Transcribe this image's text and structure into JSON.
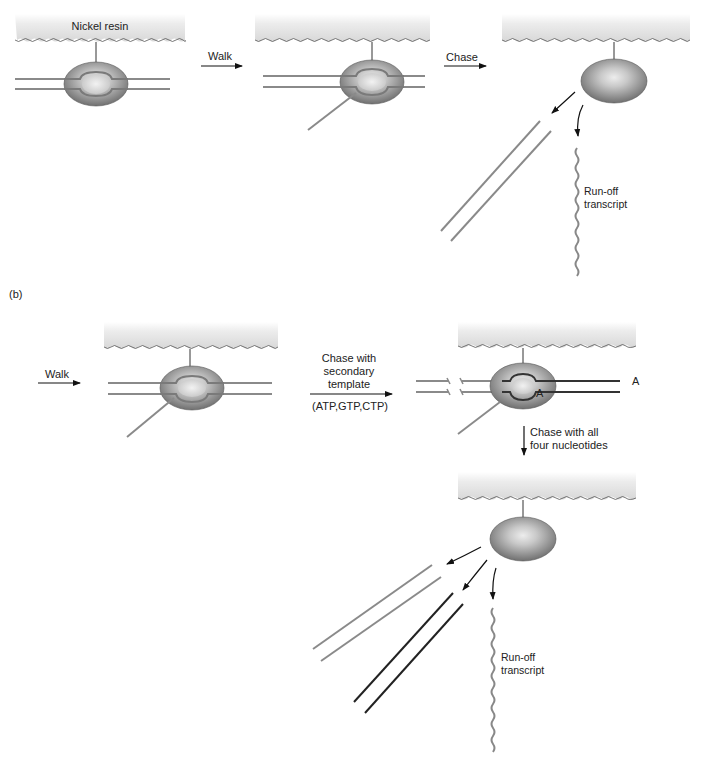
{
  "figure": {
    "panel_a": {
      "label": "",
      "resin_label": "Nickel resin",
      "step1_arrow": "Walk",
      "step2_arrow": "Chase",
      "product_label_line1": "Run-off",
      "product_label_line2": "transcript"
    },
    "panel_b": {
      "label": "(b)",
      "step1_arrow": "Walk",
      "step2_arrow_line1": "Chase with",
      "step2_arrow_line2": "secondary",
      "step2_arrow_line3": "template",
      "step2_nucleotides": "(ATP,GTP,CTP)",
      "nucleotide_marker_top": "A",
      "nucleotide_marker_bottom": "A",
      "step3_arrow_line1": "Chase with all",
      "step3_arrow_line2": "four nucleotides",
      "product_label_line1": "Run-off",
      "product_label_line2": "transcript"
    }
  },
  "colors": {
    "resin_fill": "#e4e4e4",
    "polymerase_dark": "#6e6e6e",
    "polymerase_light": "#e8e8e8",
    "dna_gray": "#8a8a8a",
    "dna_dark": "#2a2a2a",
    "arrow": "#111111",
    "text": "#222222"
  }
}
